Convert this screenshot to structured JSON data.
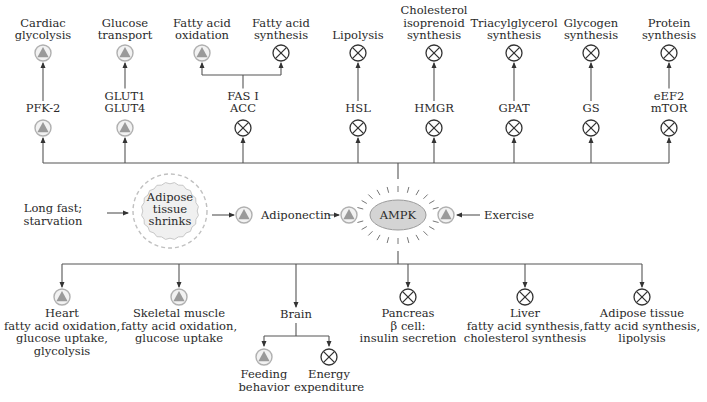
{
  "colors": {
    "line": "#555555",
    "activate_ring": "#b0b0b0",
    "activate_fill": "#f2f2f2",
    "activate_triangle": "#9a9a9a",
    "inhibit_stroke": "#333333",
    "ampk_fill": "#d4d4d4",
    "adipose_fill": "#f0f0f0",
    "adipose_dash": "#c0c0c0"
  },
  "icons": {
    "activate": "triangle-in-circle (activation)",
    "inhibit": "circled-x (inhibition)"
  },
  "center": {
    "ampk": "AMPK",
    "exercise": "Exercise",
    "adiponectin": "Adiponectin",
    "long_fast": [
      "Long fast;",
      "starvation"
    ],
    "adipose_shrinks": [
      "Adipose",
      "tissue",
      "shrinks"
    ]
  },
  "top_targets": [
    {
      "x": 43,
      "process": [
        "Cardiac",
        "glycolysis"
      ],
      "process_effect": "activate",
      "enzyme": [
        "PFK-2"
      ],
      "enzyme_effect": "activate"
    },
    {
      "x": 125,
      "process": [
        "Glucose",
        "transport"
      ],
      "process_effect": "activate",
      "enzyme": [
        "GLUT1",
        "GLUT4"
      ],
      "enzyme_effect": "activate"
    },
    {
      "x": 243,
      "enzyme": [
        "FAS I",
        "ACC"
      ],
      "enzyme_effect": "inhibit"
    },
    {
      "x": 358,
      "process": [
        "Lipolysis"
      ],
      "process_effect": "inhibit",
      "enzyme": [
        "HSL"
      ],
      "enzyme_effect": "inhibit"
    },
    {
      "x": 434,
      "process": [
        "Cholesterol",
        "isoprenoid",
        "synthesis"
      ],
      "process_effect": "inhibit",
      "enzyme": [
        "HMGR"
      ],
      "enzyme_effect": "inhibit"
    },
    {
      "x": 514,
      "process": [
        "Triacylglycerol",
        "synthesis"
      ],
      "process_effect": "inhibit",
      "enzyme": [
        "GPAT"
      ],
      "enzyme_effect": "inhibit"
    },
    {
      "x": 591,
      "process": [
        "Glycogen",
        "synthesis"
      ],
      "process_effect": "inhibit",
      "enzyme": [
        "GS"
      ],
      "enzyme_effect": "inhibit"
    },
    {
      "x": 669,
      "process": [
        "Protein",
        "synthesis"
      ],
      "process_effect": "inhibit",
      "enzyme": [
        "eEF2",
        "mTOR"
      ],
      "enzyme_effect": "inhibit"
    }
  ],
  "fas_branches": [
    {
      "x": 202,
      "process": [
        "Fatty acid",
        "oxidation"
      ],
      "effect": "activate"
    },
    {
      "x": 281,
      "process": [
        "Fatty acid",
        "synthesis"
      ],
      "effect": "inhibit"
    }
  ],
  "tissues": [
    {
      "x": 62,
      "effect": "activate",
      "lines": [
        "Heart",
        "fatty acid oxidation,",
        "glucose uptake,",
        "glycolysis"
      ]
    },
    {
      "x": 179,
      "effect": "activate",
      "lines": [
        "Skeletal muscle",
        "fatty acid oxidation,",
        "glucose uptake"
      ]
    },
    {
      "x": 296,
      "effect": null,
      "lines": [
        "Brain"
      ]
    },
    {
      "x": 408,
      "effect": "inhibit",
      "lines": [
        "Pancreas",
        "β cell:",
        "insulin secretion"
      ]
    },
    {
      "x": 525,
      "effect": "inhibit",
      "lines": [
        "Liver",
        "fatty acid synthesis,",
        "cholesterol synthesis"
      ]
    },
    {
      "x": 642,
      "effect": "inhibit",
      "lines": [
        "Adipose tissue",
        "fatty acid synthesis,",
        "lipolysis"
      ]
    }
  ],
  "brain_branches": [
    {
      "x": 264,
      "effect": "activate",
      "lines": [
        "Feeding",
        "behavior"
      ]
    },
    {
      "x": 329,
      "effect": "inhibit",
      "lines": [
        "Energy",
        "expenditure"
      ]
    }
  ]
}
